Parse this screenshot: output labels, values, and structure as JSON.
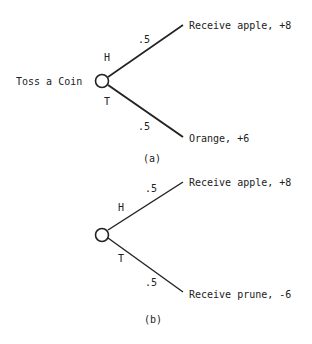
{
  "diagram_a": {
    "root_label": "Toss a Coin",
    "branch_top": {
      "event": "H",
      "prob": ".5",
      "outcome": "Receive apple, +8"
    },
    "branch_bottom": {
      "event": "T",
      "prob": ".5",
      "outcome": "Orange, +6"
    },
    "caption": "(a)"
  },
  "diagram_b": {
    "branch_top": {
      "event": "H",
      "prob": ".5",
      "outcome": "Receive apple, +8"
    },
    "branch_bottom": {
      "event": "T",
      "prob": ".5",
      "outcome": "Receive prune, -6"
    },
    "caption": "(b)"
  }
}
